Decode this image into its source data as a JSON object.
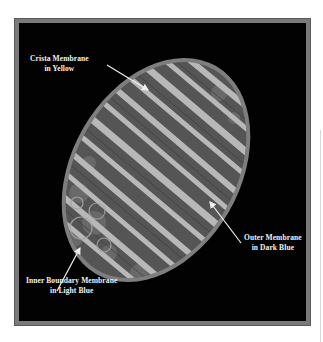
{
  "figure": {
    "colors": {
      "background": "#020202",
      "frame": "#7a7a7a",
      "outer_membrane": "#8a8a8a",
      "matrix": "#5c5c5c",
      "crista": "#b4b4b4",
      "label_text": "#f2f2f2"
    },
    "labels": [
      {
        "id": "crista",
        "line1": "Crista Membrane",
        "line2": "in Yellow"
      },
      {
        "id": "outer",
        "line1": "Outer Membrane",
        "line2": "in Dark Blue"
      },
      {
        "id": "inner",
        "line1": "Inner Boundary Membrane",
        "line2": "in Light Blue"
      }
    ]
  }
}
